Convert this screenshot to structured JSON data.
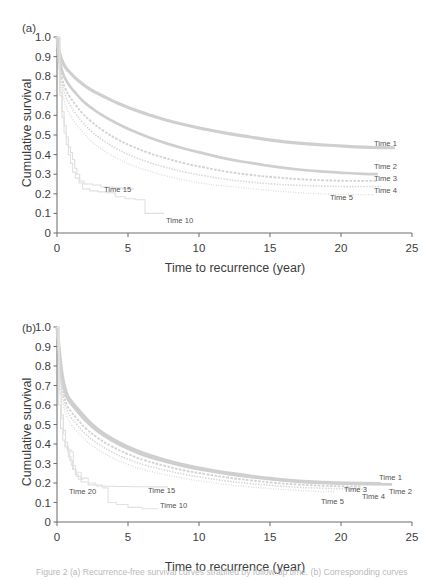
{
  "figure": {
    "panels": [
      {
        "tag": "(a)",
        "xlabel": "Time to recurrence (year)",
        "ylabel": "Cumulative survival",
        "xticks": [
          "0",
          "5",
          "10",
          "15",
          "20",
          "25"
        ],
        "yticks": [
          "0",
          "0.1",
          "0.2",
          "0.3",
          "0.4",
          "0.5",
          "0.6",
          "0.7",
          "0.8",
          "0.9",
          "1.0"
        ],
        "labels": [
          {
            "text": "Time 1",
            "x": 374,
            "y": 146
          },
          {
            "text": "Time 2",
            "x": 374,
            "y": 169
          },
          {
            "text": "Time 3",
            "x": 374,
            "y": 181
          },
          {
            "text": "Time 4",
            "x": 374,
            "y": 193
          },
          {
            "text": "Time 5",
            "x": 330,
            "y": 200
          },
          {
            "text": "Time 15",
            "x": 104,
            "y": 192
          },
          {
            "text": "Time 10",
            "x": 166,
            "y": 223
          }
        ]
      },
      {
        "tag": "(b)",
        "xlabel": "Time to recurrence (year)",
        "ylabel": "Cumulative survival",
        "xticks": [
          "0",
          "5",
          "10",
          "15",
          "20",
          "25"
        ],
        "yticks": [
          "0",
          "0.1",
          "0.2",
          "0.3",
          "0.4",
          "0.5",
          "0.6",
          "0.7",
          "0.8",
          "0.9",
          "1.0"
        ],
        "labels": [
          {
            "text": "Time 1",
            "x": 379,
            "y": 190
          },
          {
            "text": "Time 2",
            "x": 389,
            "y": 204
          },
          {
            "text": "Time 3",
            "x": 344,
            "y": 202
          },
          {
            "text": "Time 4",
            "x": 362,
            "y": 209
          },
          {
            "text": "Time 5",
            "x": 321,
            "y": 214
          },
          {
            "text": "Time 15",
            "x": 148,
            "y": 203
          },
          {
            "text": "Time 20",
            "x": 69,
            "y": 204
          },
          {
            "text": "Time 10",
            "x": 160,
            "y": 218
          }
        ]
      }
    ],
    "caption": "Figure 2  (a) Recurrence-free survival curves stratified by follow-up time. (b) Corresponding curves"
  },
  "chart_data": [
    {
      "type": "line",
      "panel": "(a)",
      "title": "",
      "xlabel": "Time to recurrence (year)",
      "ylabel": "Cumulative survival",
      "xlim": [
        0,
        25
      ],
      "ylim": [
        0,
        1.0
      ],
      "xticks": [
        0,
        5,
        10,
        15,
        20,
        25
      ],
      "yticks": [
        0,
        0.1,
        0.2,
        0.3,
        0.4,
        0.5,
        0.6,
        0.7,
        0.8,
        0.9,
        1.0
      ],
      "grid": false,
      "legend": "inline-right",
      "series": [
        {
          "name": "Time 1",
          "color": "#cfcfcf",
          "width": 3.2,
          "dash": "none",
          "x": [
            0,
            0.15,
            0.35,
            0.6,
            0.9,
            1.3,
            1.8,
            2.4,
            3.2,
            4.2,
            5.2,
            6.4,
            7.6,
            9.0,
            10.4,
            12.0,
            13.6,
            15.2,
            17.0,
            18.8,
            20.4,
            21.6,
            22.6,
            23.8
          ],
          "y": [
            1.0,
            0.93,
            0.88,
            0.845,
            0.82,
            0.79,
            0.76,
            0.73,
            0.7,
            0.665,
            0.635,
            0.605,
            0.578,
            0.552,
            0.53,
            0.508,
            0.49,
            0.473,
            0.459,
            0.449,
            0.442,
            0.438,
            0.436,
            0.435
          ]
        },
        {
          "name": "Time 2",
          "color": "#cfcfcf",
          "width": 2.7,
          "dash": "none",
          "x": [
            0,
            0.15,
            0.35,
            0.6,
            0.9,
            1.3,
            1.8,
            2.4,
            3.2,
            4.2,
            5.2,
            6.4,
            7.6,
            9.0,
            10.4,
            12.0,
            13.6,
            15.2,
            17.0,
            18.8,
            20.4,
            21.6,
            22.6
          ],
          "y": [
            1.0,
            0.9,
            0.83,
            0.785,
            0.75,
            0.715,
            0.675,
            0.64,
            0.6,
            0.56,
            0.525,
            0.49,
            0.46,
            0.43,
            0.405,
            0.378,
            0.358,
            0.34,
            0.324,
            0.313,
            0.306,
            0.302,
            0.3
          ]
        },
        {
          "name": "Time 3",
          "color": "#d3d3d3",
          "width": 1.9,
          "dash": "2.6 1.4",
          "x": [
            0,
            0.15,
            0.35,
            0.6,
            0.9,
            1.3,
            1.8,
            2.4,
            3.2,
            4.2,
            5.2,
            6.4,
            7.6,
            9.0,
            10.4,
            12.0,
            13.6,
            15.2,
            17.0,
            18.8,
            20.4,
            21.6,
            22.6
          ],
          "y": [
            1.0,
            0.875,
            0.79,
            0.735,
            0.695,
            0.655,
            0.61,
            0.57,
            0.525,
            0.48,
            0.445,
            0.41,
            0.383,
            0.355,
            0.334,
            0.312,
            0.297,
            0.285,
            0.275,
            0.269,
            0.266,
            0.266,
            0.266
          ]
        },
        {
          "name": "Time 4",
          "color": "#d6d6d6",
          "width": 1.6,
          "dash": "1.4 1.4",
          "x": [
            0,
            0.15,
            0.35,
            0.6,
            0.9,
            1.3,
            1.8,
            2.4,
            3.2,
            4.2,
            5.2,
            6.4,
            7.6,
            9.0,
            10.4,
            12.0,
            13.6,
            15.2,
            17.0,
            18.8,
            20.4,
            21.6,
            22.8
          ],
          "y": [
            1.0,
            0.855,
            0.76,
            0.7,
            0.655,
            0.61,
            0.565,
            0.52,
            0.475,
            0.43,
            0.395,
            0.362,
            0.336,
            0.311,
            0.292,
            0.273,
            0.26,
            0.25,
            0.243,
            0.239,
            0.237,
            0.237,
            0.237
          ]
        },
        {
          "name": "Time 5",
          "color": "#dadada",
          "width": 1.35,
          "dash": "0.9 1.6",
          "x": [
            0,
            0.15,
            0.35,
            0.6,
            0.9,
            1.3,
            1.8,
            2.4,
            3.2,
            4.2,
            5.2,
            6.4,
            7.6,
            9.0,
            10.4,
            11.6,
            12.8,
            14.0,
            15.4,
            17.0,
            18.6,
            20.0,
            21.4,
            22.4
          ],
          "y": [
            1.0,
            0.83,
            0.725,
            0.655,
            0.605,
            0.56,
            0.515,
            0.47,
            0.425,
            0.382,
            0.348,
            0.318,
            0.293,
            0.27,
            0.252,
            0.241,
            0.233,
            0.224,
            0.215,
            0.206,
            0.2,
            0.197,
            0.196,
            0.196
          ]
        },
        {
          "name": "Time 15",
          "color": "#dedede",
          "width": 1.1,
          "dash": "none",
          "step": true,
          "x": [
            0,
            0.2,
            0.35,
            0.5,
            0.65,
            0.8,
            0.95,
            1.1,
            1.25,
            1.4,
            1.6,
            1.9,
            2.5,
            3.1,
            3.9,
            4.6,
            5.4
          ],
          "y": [
            1.0,
            0.72,
            0.62,
            0.55,
            0.49,
            0.44,
            0.41,
            0.375,
            0.33,
            0.3,
            0.265,
            0.25,
            0.245,
            0.235,
            0.23,
            0.225,
            0.222
          ]
        },
        {
          "name": "Time 10",
          "color": "#e0e0e0",
          "width": 1.1,
          "dash": "none",
          "step": true,
          "x": [
            0,
            0.2,
            0.35,
            0.5,
            0.65,
            0.8,
            0.95,
            1.1,
            1.3,
            1.55,
            1.8,
            2.3,
            2.9,
            3.5,
            4.1,
            4.8,
            5.5,
            6.2,
            7.5
          ],
          "y": [
            1.0,
            0.7,
            0.59,
            0.51,
            0.45,
            0.4,
            0.355,
            0.31,
            0.28,
            0.255,
            0.225,
            0.215,
            0.21,
            0.205,
            0.185,
            0.175,
            0.17,
            0.1,
            0.095
          ]
        }
      ]
    },
    {
      "type": "line",
      "panel": "(b)",
      "title": "",
      "xlabel": "Time to recurrence (year)",
      "ylabel": "Cumulative survival",
      "xlim": [
        0,
        25
      ],
      "ylim": [
        0,
        1.0
      ],
      "xticks": [
        0,
        5,
        10,
        15,
        20,
        25
      ],
      "yticks": [
        0,
        0.1,
        0.2,
        0.3,
        0.4,
        0.5,
        0.6,
        0.7,
        0.8,
        0.9,
        1.0
      ],
      "grid": false,
      "legend": "inline-right",
      "series": [
        {
          "name": "Time 1",
          "color": "#cfcfcf",
          "width": 3.2,
          "dash": "none",
          "x": [
            0,
            0.1,
            0.25,
            0.45,
            0.7,
            1.0,
            1.4,
            2.0,
            2.8,
            3.8,
            5.0,
            6.2,
            7.6,
            9.0,
            10.5,
            12.0,
            13.6,
            15.2,
            17.0,
            18.8,
            20.4,
            21.8,
            22.8
          ],
          "y": [
            1.0,
            0.93,
            0.82,
            0.72,
            0.655,
            0.62,
            0.585,
            0.535,
            0.48,
            0.43,
            0.385,
            0.35,
            0.318,
            0.292,
            0.27,
            0.252,
            0.236,
            0.222,
            0.21,
            0.203,
            0.199,
            0.198,
            0.197
          ]
        },
        {
          "name": "Time 2",
          "color": "#cfcfcf",
          "width": 2.6,
          "dash": "none",
          "x": [
            0,
            0.1,
            0.25,
            0.45,
            0.7,
            1.0,
            1.4,
            2.0,
            2.8,
            3.8,
            5.0,
            6.2,
            7.6,
            9.0,
            10.5,
            12.0,
            13.6,
            15.2,
            17.0,
            18.8,
            20.4,
            22.0,
            23.6
          ],
          "y": [
            1.0,
            0.92,
            0.8,
            0.7,
            0.64,
            0.605,
            0.57,
            0.52,
            0.468,
            0.42,
            0.375,
            0.34,
            0.31,
            0.285,
            0.264,
            0.246,
            0.231,
            0.218,
            0.207,
            0.2,
            0.196,
            0.194,
            0.193
          ]
        },
        {
          "name": "Time 3",
          "color": "#d3d3d3",
          "width": 1.9,
          "dash": "2.6 1.4",
          "x": [
            0,
            0.1,
            0.25,
            0.45,
            0.7,
            1.0,
            1.4,
            2.0,
            2.8,
            3.8,
            5.0,
            6.2,
            7.6,
            9.0,
            10.5,
            12.0,
            13.6,
            15.2,
            17.0,
            18.8,
            20.2,
            21.4
          ],
          "y": [
            1.0,
            0.9,
            0.77,
            0.665,
            0.6,
            0.565,
            0.53,
            0.482,
            0.435,
            0.39,
            0.348,
            0.316,
            0.288,
            0.264,
            0.245,
            0.228,
            0.214,
            0.202,
            0.192,
            0.186,
            0.183,
            0.182
          ]
        },
        {
          "name": "Time 4",
          "color": "#d6d6d6",
          "width": 1.6,
          "dash": "1.4 1.4",
          "x": [
            0,
            0.1,
            0.25,
            0.45,
            0.7,
            1.0,
            1.4,
            2.0,
            2.8,
            3.8,
            5.0,
            6.2,
            7.6,
            9.0,
            10.5,
            12.0,
            13.6,
            15.2,
            17.0,
            18.8,
            20.4,
            21.8
          ],
          "y": [
            1.0,
            0.88,
            0.74,
            0.635,
            0.575,
            0.535,
            0.5,
            0.452,
            0.405,
            0.362,
            0.322,
            0.292,
            0.266,
            0.244,
            0.226,
            0.21,
            0.197,
            0.187,
            0.178,
            0.173,
            0.17,
            0.169
          ]
        },
        {
          "name": "Time 5",
          "color": "#dadada",
          "width": 1.35,
          "dash": "0.9 1.6",
          "x": [
            0,
            0.1,
            0.25,
            0.45,
            0.7,
            1.0,
            1.4,
            2.0,
            2.8,
            3.8,
            5.0,
            6.2,
            7.6,
            9.0,
            10.5,
            12.0,
            13.6,
            15.2,
            17.0,
            18.4,
            19.6
          ],
          "y": [
            1.0,
            0.86,
            0.71,
            0.6,
            0.54,
            0.5,
            0.465,
            0.42,
            0.375,
            0.332,
            0.295,
            0.267,
            0.243,
            0.223,
            0.206,
            0.192,
            0.18,
            0.17,
            0.162,
            0.157,
            0.155
          ]
        },
        {
          "name": "Time 15",
          "color": "#dedede",
          "width": 1.1,
          "dash": "none",
          "step": true,
          "x": [
            0,
            0.15,
            0.3,
            0.45,
            0.6,
            0.75,
            0.9,
            1.1,
            1.35,
            1.7,
            2.2,
            2.8,
            3.4,
            4.2,
            5.2,
            6.4,
            7.8
          ],
          "y": [
            1.0,
            0.68,
            0.55,
            0.47,
            0.41,
            0.36,
            0.315,
            0.27,
            0.235,
            0.205,
            0.19,
            0.185,
            0.183,
            0.182,
            0.181,
            0.18,
            0.179
          ]
        },
        {
          "name": "Time 20",
          "color": "#e0e0e0",
          "width": 1.1,
          "dash": "none",
          "step": true,
          "x": [
            0,
            0.12,
            0.25,
            0.4,
            0.55,
            0.7,
            0.85,
            1.0,
            1.15,
            1.3,
            1.5,
            1.8
          ],
          "y": [
            1.0,
            0.6,
            0.48,
            0.42,
            0.385,
            0.375,
            0.37,
            0.36,
            0.27,
            0.245,
            0.22,
            0.215
          ]
        },
        {
          "name": "Time 10",
          "color": "#e2e2e2",
          "width": 1.1,
          "dash": "none",
          "step": true,
          "x": [
            0,
            0.15,
            0.3,
            0.45,
            0.6,
            0.8,
            1.0,
            1.3,
            1.7,
            2.2,
            2.7,
            3.2,
            3.6,
            4.2,
            5.0,
            6.0,
            7.1
          ],
          "y": [
            1.0,
            0.66,
            0.53,
            0.45,
            0.39,
            0.335,
            0.29,
            0.255,
            0.225,
            0.2,
            0.19,
            0.175,
            0.1,
            0.09,
            0.075,
            0.068,
            0.065
          ]
        }
      ]
    }
  ]
}
